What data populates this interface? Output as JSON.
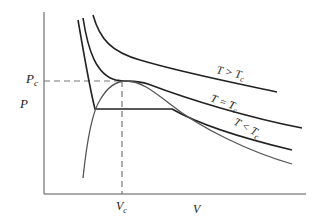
{
  "diagram": {
    "type": "pv-isotherms",
    "axes": {
      "y_label": "P",
      "x_label": "V"
    },
    "critical_point": {
      "pressure_label": "P",
      "pressure_sub": "c",
      "volume_label": "V",
      "volume_sub": "c"
    },
    "curves": [
      {
        "id": "above-critical",
        "label_main": "T > T",
        "label_sub": "c"
      },
      {
        "id": "critical",
        "label_main": "T = T",
        "label_sub": "c"
      },
      {
        "id": "below-critical",
        "label_main": "T < T",
        "label_sub": "c"
      }
    ],
    "colors": {
      "curve": "#222222",
      "dashed": "#777777",
      "axis": "#555555",
      "coexistence": "#555555"
    }
  }
}
